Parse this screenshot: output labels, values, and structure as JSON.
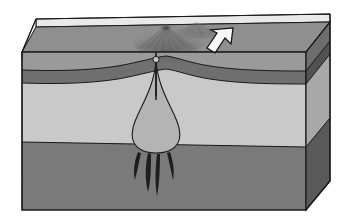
{
  "figure": {
    "title": "Volcano block diagram",
    "type": "geologic-block-diagram",
    "width": 352,
    "height": 221
  },
  "colors": {
    "background": "#ffffff",
    "outline": "#1a1a1a",
    "top_surface": "#8f8f8f",
    "back_rim": "#e4e4e4",
    "layer_surface_front": "#9a9a9a",
    "layer_dark_band": "#6f6f6f",
    "layer_light_front": "#c9c9c9",
    "layer_deep_front": "#7a7a7a",
    "side_surface": "#6d6d6d",
    "side_dark_band": "#525252",
    "side_light": "#a8a8a8",
    "side_deep": "#5a5a5a",
    "magma_chamber": "#b4b4b4",
    "conduit": "#2b2b2b",
    "dike": "#1e1e1e",
    "arrow_fill": "#f7f7f7",
    "arrow_outline": "#111111",
    "volcano_shade": "#6b6b6b"
  },
  "features": [
    {
      "id": "volcano-cone",
      "label": "Volcanic cone",
      "interactable": false
    },
    {
      "id": "back-cone",
      "label": "Secondary ridge",
      "interactable": false
    },
    {
      "id": "vent",
      "label": "Summit vent",
      "interactable": false
    },
    {
      "id": "conduit",
      "label": "Volcanic conduit",
      "interactable": false
    },
    {
      "id": "conduit-node",
      "label": "Conduit node",
      "interactable": false
    },
    {
      "id": "magma-chamber",
      "label": "Magma chamber",
      "interactable": false
    },
    {
      "id": "root-dike-1",
      "label": "Root dike (left outer)",
      "interactable": false
    },
    {
      "id": "root-dike-2",
      "label": "Root dike (left inner)",
      "interactable": false
    },
    {
      "id": "root-dike-3",
      "label": "Root dike (center)",
      "interactable": false
    },
    {
      "id": "root-dike-4",
      "label": "Root dike (right)",
      "interactable": false
    },
    {
      "id": "motion-arrow",
      "label": "Plate motion arrow",
      "interactable": false
    },
    {
      "id": "downwarp",
      "label": "Crustal downwarp",
      "interactable": false
    }
  ],
  "layers": [
    {
      "id": "surface-layer",
      "name": "Surface layer",
      "tone": "medium-gray"
    },
    {
      "id": "dark-band",
      "name": "Dark stratum",
      "tone": "dark-gray"
    },
    {
      "id": "light-layer",
      "name": "Light stratum",
      "tone": "light-gray"
    },
    {
      "id": "deep-layer",
      "name": "Deep stratum",
      "tone": "mid-dark-gray"
    }
  ]
}
